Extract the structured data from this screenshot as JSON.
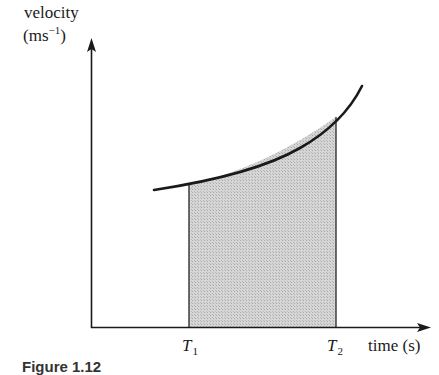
{
  "figure": {
    "y_axis_label_line1": "velocity",
    "y_axis_label_unit_open": "(ms",
    "y_axis_label_unit_sup": "−1",
    "y_axis_label_unit_close": ")",
    "x_axis_label": "time (s)",
    "t1_label": "T",
    "t1_sub": "1",
    "t2_label": "T",
    "t2_sub": "2",
    "caption": "Figure 1.12",
    "colors": {
      "line": "#1a1a1a",
      "shade": "#cfcfcf",
      "background": "#ffffff"
    }
  }
}
